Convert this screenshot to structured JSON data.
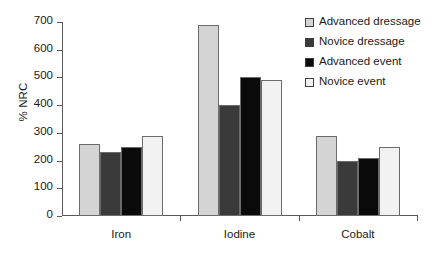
{
  "chart_data": {
    "type": "bar",
    "title": "",
    "xlabel": "",
    "ylabel": "% NRC",
    "ylim": [
      0,
      700
    ],
    "ytick_step": 100,
    "yticks": [
      "700",
      "600",
      "500",
      "400",
      "300",
      "200",
      "100",
      "0"
    ],
    "grid": false,
    "legend_position": "right",
    "categories": [
      "Iron",
      "Iodine",
      "Cobalt"
    ],
    "series": [
      {
        "name": "Advanced dressage",
        "color": "#d4d4d4",
        "values": [
          260,
          690,
          290
        ]
      },
      {
        "name": "Novice dressage",
        "color": "#3a3a3a",
        "values": [
          230,
          400,
          200
        ]
      },
      {
        "name": "Advanced event",
        "color": "#0a0a0a",
        "values": [
          250,
          500,
          210
        ]
      },
      {
        "name": "Novice event",
        "color": "#f2f2f2",
        "values": [
          290,
          490,
          250
        ]
      }
    ]
  }
}
